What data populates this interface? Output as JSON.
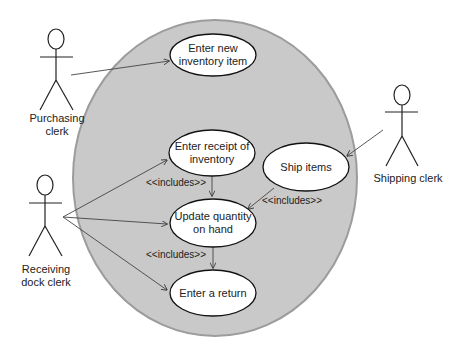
{
  "diagram": {
    "type": "UML use case diagram",
    "system_boundary": {
      "shape": "ellipse",
      "fill": "#c8c8c8",
      "stroke": "#9a9a9a"
    },
    "actors": [
      {
        "id": "purchasing",
        "label_line1": "Purchasing",
        "label_line2": "clerk"
      },
      {
        "id": "receiving",
        "label_line1": "Receiving",
        "label_line2": "dock clerk"
      },
      {
        "id": "shipping",
        "label_line1": "Shipping clerk",
        "label_line2": ""
      }
    ],
    "use_cases": [
      {
        "id": "enter-new",
        "line1": "Enter new",
        "line2": "inventory item"
      },
      {
        "id": "enter-receipt",
        "line1": "Enter receipt of",
        "line2": "inventory"
      },
      {
        "id": "ship-items",
        "line1": "Ship items",
        "line2": ""
      },
      {
        "id": "update-qty",
        "line1": "Update quantity",
        "line2": "on hand"
      },
      {
        "id": "enter-return",
        "line1": "Enter a return",
        "line2": ""
      }
    ],
    "relationships": [
      {
        "from": "purchasing",
        "to": "enter-new",
        "type": "association"
      },
      {
        "from": "receiving",
        "to": "enter-receipt",
        "type": "association"
      },
      {
        "from": "receiving",
        "to": "update-qty",
        "type": "association"
      },
      {
        "from": "receiving",
        "to": "enter-return",
        "type": "association"
      },
      {
        "from": "shipping",
        "to": "ship-items",
        "type": "association"
      },
      {
        "from": "enter-receipt",
        "to": "update-qty",
        "type": "include",
        "label": "<<includes>>"
      },
      {
        "from": "ship-items",
        "to": "update-qty",
        "type": "include",
        "label": "<<includes>>"
      },
      {
        "from": "update-qty",
        "to": "enter-return",
        "type": "include",
        "label": "<<includes>>"
      }
    ],
    "include_labels": {
      "receipt_to_update": "<<includes>>",
      "ship_to_update": "<<includes>>",
      "update_to_return": "<<includes>>"
    }
  }
}
